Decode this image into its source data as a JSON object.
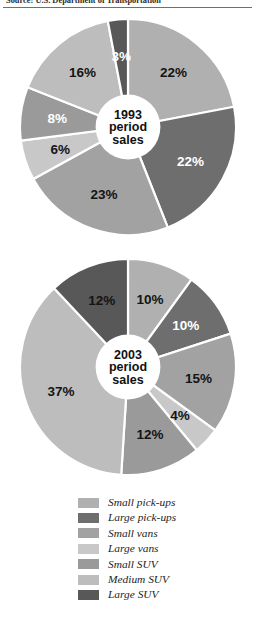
{
  "source_caption": "Source: U.S. Department of Transportation",
  "colors": {
    "small_pickups": "#b0b0b0",
    "large_pickups": "#6e6e6e",
    "small_vans": "#a2a2a2",
    "large_vans": "#c8c8c8",
    "small_suv": "#9a9a9a",
    "medium_suv": "#bdbdbd",
    "large_suv": "#585858",
    "divider": "#ffffff",
    "center_fill": "#ffffff",
    "text_dark": "#141414",
    "text_light": "#ffffff"
  },
  "legend": {
    "items": [
      {
        "key": "small_pickups",
        "label": "Small pick-ups",
        "color": "#b0b0b0"
      },
      {
        "key": "large_pickups",
        "label": "Large pick-ups",
        "color": "#6e6e6e"
      },
      {
        "key": "small_vans",
        "label": "Small vans",
        "color": "#a2a2a2"
      },
      {
        "key": "large_vans",
        "label": "Large vans",
        "color": "#c8c8c8"
      },
      {
        "key": "small_suv",
        "label": "Small SUV",
        "color": "#9a9a9a"
      },
      {
        "key": "medium_suv",
        "label": "Medium SUV",
        "color": "#bdbdbd"
      },
      {
        "key": "large_suv",
        "label": "Large SUV",
        "color": "#585858"
      }
    ]
  },
  "chart_data": [
    {
      "type": "pie",
      "id": "pie-1993",
      "title": "1993 period sales",
      "center_lines": [
        "1993",
        "period",
        "sales"
      ],
      "start_angle": 0,
      "donut_hole_ratio": 0.3,
      "categories": [
        "Small pick-ups",
        "Large pick-ups",
        "Small vans",
        "Large vans",
        "Small SUV",
        "Medium SUV",
        "Large SUV"
      ],
      "values": [
        22,
        22,
        23,
        6,
        8,
        16,
        3
      ],
      "labels": [
        "22%",
        "22%",
        "23%",
        "6%",
        "8%",
        "16%",
        "3%"
      ],
      "slice_colors": [
        "#b0b0b0",
        "#6e6e6e",
        "#a2a2a2",
        "#c8c8c8",
        "#9a9a9a",
        "#bdbdbd",
        "#585858"
      ],
      "label_on_dark": [
        false,
        true,
        false,
        false,
        true,
        false,
        true
      ],
      "label_radius": 0.66
    },
    {
      "type": "pie",
      "id": "pie-2003",
      "title": "2003 period sales",
      "center_lines": [
        "2003",
        "period",
        "sales"
      ],
      "start_angle": 0,
      "donut_hole_ratio": 0.3,
      "categories": [
        "Small pick-ups",
        "Large pick-ups",
        "Small vans",
        "Large vans",
        "Small SUV",
        "Medium SUV",
        "Large SUV"
      ],
      "values": [
        10,
        10,
        15,
        4,
        12,
        37,
        12
      ],
      "labels": [
        "10%",
        "10%",
        "15%",
        "4%",
        "12%",
        "37%",
        "12%"
      ],
      "slice_colors": [
        "#b0b0b0",
        "#6e6e6e",
        "#a2a2a2",
        "#c8c8c8",
        "#9a9a9a",
        "#bdbdbd",
        "#585858"
      ],
      "label_on_dark": [
        false,
        true,
        false,
        false,
        false,
        false,
        false
      ],
      "label_radius": 0.66
    }
  ]
}
